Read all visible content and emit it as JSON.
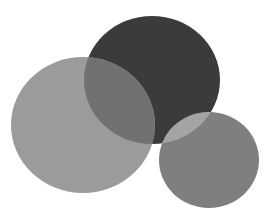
{
  "image": {
    "width": 274,
    "height": 217,
    "background": "#ffffff",
    "description": "Three overlapping gray circles"
  },
  "shapes": [
    {
      "name": "dark-circle",
      "cx": 152,
      "cy": 80,
      "rx": 68,
      "ry": 64,
      "fill": "#3b3b3b"
    },
    {
      "name": "left-circle",
      "cx": 83,
      "cy": 125,
      "rx": 72,
      "ry": 68,
      "fill": "#9b9b9b"
    },
    {
      "name": "small-circle",
      "cx": 209,
      "cy": 160,
      "rx": 50,
      "ry": 48,
      "fill": "#7f7f7f"
    }
  ],
  "overlaps": [
    {
      "name": "left-dark-overlap",
      "fill": "#717171"
    },
    {
      "name": "small-dark-overlap",
      "fill": "#a4a4a4"
    }
  ]
}
